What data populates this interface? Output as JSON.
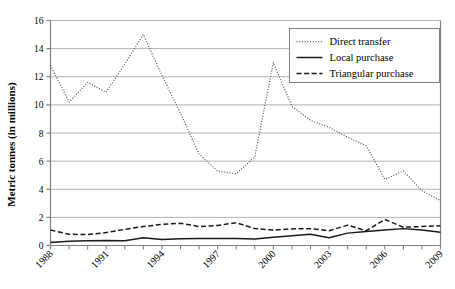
{
  "chart_data": {
    "type": "line",
    "title": "",
    "xlabel": "",
    "ylabel": "Metric tonnes (in millions)",
    "ylim": [
      0,
      16
    ],
    "yticks": [
      0,
      2,
      4,
      6,
      8,
      10,
      12,
      14,
      16
    ],
    "ytick_labels": [
      "0",
      "2",
      "4",
      "6",
      "8",
      "10",
      "12",
      "14",
      "16"
    ],
    "grid": "horizontal",
    "legend_position": "top-right",
    "x": [
      1988,
      1989,
      1990,
      1991,
      1992,
      1993,
      1994,
      1995,
      1996,
      1997,
      1998,
      1999,
      2000,
      2001,
      2002,
      2003,
      2004,
      2005,
      2006,
      2007,
      2008,
      2009
    ],
    "xtick_labels": [
      "1988",
      "1991",
      "1994",
      "1997",
      "2000",
      "2003",
      "2006",
      "2009"
    ],
    "xtick_years": [
      1988,
      1991,
      1994,
      1997,
      2000,
      2003,
      2006,
      2009
    ],
    "series": [
      {
        "name": "Direct transfer",
        "style": "dotted",
        "color": "#555555",
        "values": [
          12.8,
          10.2,
          11.6,
          10.9,
          12.9,
          15.0,
          12.1,
          9.4,
          6.5,
          5.3,
          5.1,
          6.3,
          13.0,
          9.9,
          8.9,
          8.4,
          7.7,
          7.1,
          4.7,
          5.3,
          3.9,
          3.2
        ]
      },
      {
        "name": "Local purchase",
        "style": "solid",
        "color": "#1a1a1a",
        "values": [
          0.22,
          0.3,
          0.33,
          0.35,
          0.33,
          0.55,
          0.42,
          0.48,
          0.5,
          0.5,
          0.5,
          0.47,
          0.58,
          0.7,
          0.8,
          0.55,
          0.88,
          1.0,
          1.1,
          1.2,
          1.1,
          0.95
        ]
      },
      {
        "name": "Triangular purchase",
        "style": "dashed",
        "color": "#1a1a1a",
        "values": [
          1.1,
          0.8,
          0.78,
          0.92,
          1.15,
          1.35,
          1.5,
          1.58,
          1.35,
          1.42,
          1.62,
          1.2,
          1.1,
          1.18,
          1.2,
          1.05,
          1.45,
          1.05,
          1.85,
          1.3,
          1.35,
          1.4
        ]
      }
    ],
    "extra_points": {
      "direct_transfer_tail": [
        3.55,
        2.85
      ],
      "local_purchase_tail": [
        0.9,
        0.92
      ],
      "triangular_purchase_tail": [
        1.45,
        1.9
      ]
    }
  },
  "axes": {
    "y_axis_title": "Metric tonnes (in millions)",
    "y_tick_text": [
      "16",
      "14",
      "12",
      "10",
      "8",
      "6",
      "4",
      "2",
      "0"
    ],
    "x_tick_text": [
      "1988",
      "1991",
      "1994",
      "1997",
      "2000",
      "2003",
      "2006",
      "2009"
    ]
  },
  "legend": {
    "entries": [
      {
        "label": "Direct transfer",
        "marker": "dotted-line"
      },
      {
        "label": "Local purchase",
        "marker": "solid-line"
      },
      {
        "label": "Triangular purchase",
        "marker": "dashed-line"
      }
    ]
  },
  "colors": {
    "grid": "#b3b3b3",
    "axis": "#808080",
    "dotted_series": "#555555",
    "solid_series": "#1a1a1a",
    "dashed_series": "#1a1a1a",
    "background": "#ffffff",
    "legend_border": "#808080"
  }
}
